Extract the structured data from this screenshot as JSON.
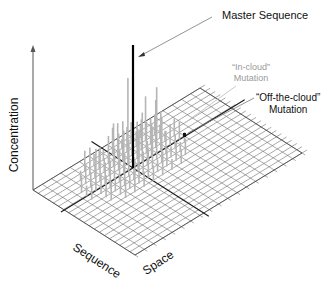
{
  "diagram": {
    "labels": {
      "master_sequence": "Master Sequence",
      "in_cloud_line1": "“In-cloud”",
      "in_cloud_line2": "Mutation",
      "off_cloud_line1": "“Off-the-cloud”",
      "off_cloud_line2": "Mutation",
      "y_axis": "Concentration",
      "x_axis_left": "Sequence",
      "x_axis_right": "Space"
    },
    "colors": {
      "master": "#000000",
      "cloud_spikes": "#b5b5b5",
      "grid": "#6e6e6e",
      "axis_lines": "#1a1a1a",
      "in_cloud_text": "#9a9a9a"
    },
    "grid": {
      "corner_left": [
        33,
        190
      ],
      "corner_top": [
        200,
        88
      ],
      "corner_right": [
        305,
        140
      ],
      "corner_bottom": [
        135,
        255
      ],
      "divisions_u": 18,
      "divisions_v": 20
    },
    "master_spike": {
      "x": 133,
      "base_y": 168,
      "top_y": 45
    },
    "off_cloud_marker": {
      "x": 185,
      "y": 135
    }
  }
}
